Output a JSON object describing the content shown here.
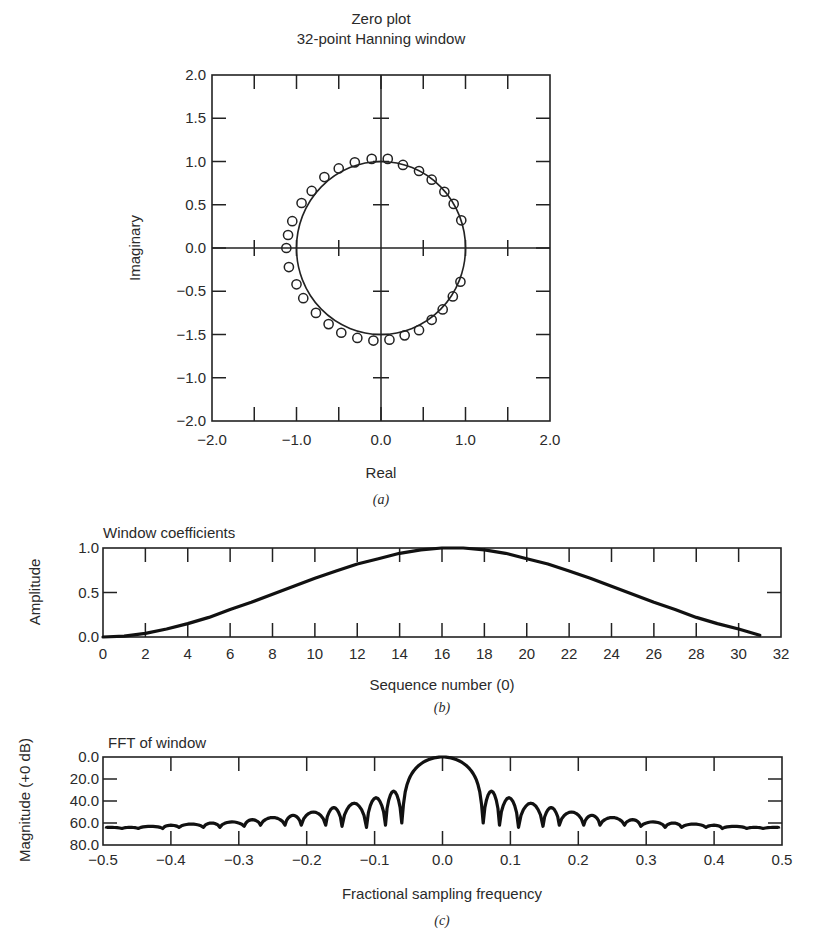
{
  "chart_data": [
    {
      "id": "a",
      "type": "scatter",
      "title": [
        "Zero plot",
        "32-point Hanning window"
      ],
      "xlabel": "Real",
      "ylabel": "Imaginary",
      "caption": "(a)",
      "xlim": [
        -2.0,
        2.0
      ],
      "ylim": [
        -2.0,
        2.0
      ],
      "xticks": [
        -2.0,
        -1.5,
        -1.0,
        -0.5,
        0.0,
        0.5,
        1.0,
        1.5,
        2.0
      ],
      "xtick_labels": [
        {
          "v": -2.0,
          "t": "−2.0"
        },
        {
          "v": -1.0,
          "t": "−1.0"
        },
        {
          "v": 0.0,
          "t": "0.0"
        },
        {
          "v": 1.0,
          "t": "1.0"
        },
        {
          "v": 2.0,
          "t": "2.0"
        }
      ],
      "yticks": [
        2.0,
        1.5,
        1.0,
        0.5,
        0.0,
        -0.5,
        -1.0,
        -1.5,
        -2.0
      ],
      "ytick_labels": [
        {
          "v": 2.0,
          "t": "2.0"
        },
        {
          "v": 1.5,
          "t": "1.5"
        },
        {
          "v": 1.0,
          "t": "1.0"
        },
        {
          "v": 0.5,
          "t": "0.5"
        },
        {
          "v": 0.0,
          "t": "0.0"
        },
        {
          "v": -0.5,
          "t": "−0.5"
        },
        {
          "v": -1.0,
          "t": "−1.5"
        },
        {
          "v": -1.5,
          "t": "−1.0"
        },
        {
          "v": -2.0,
          "t": "−2.0"
        }
      ],
      "unit_circle": true,
      "marker": "open-circle",
      "zeros": [
        [
          -1.12,
          0.0
        ],
        [
          -1.1,
          0.15
        ],
        [
          -1.05,
          0.31
        ],
        [
          -0.94,
          0.52
        ],
        [
          -0.82,
          0.66
        ],
        [
          -0.67,
          0.82
        ],
        [
          -0.5,
          0.92
        ],
        [
          -0.31,
          0.99
        ],
        [
          -0.11,
          1.03
        ],
        [
          0.08,
          1.03
        ],
        [
          0.26,
          0.96
        ],
        [
          0.45,
          0.89
        ],
        [
          0.6,
          0.79
        ],
        [
          0.75,
          0.65
        ],
        [
          0.86,
          0.51
        ],
        [
          0.95,
          0.32
        ],
        [
          -1.09,
          -0.22
        ],
        [
          -1.0,
          -0.42
        ],
        [
          -0.92,
          -0.58
        ],
        [
          -0.77,
          -0.75
        ],
        [
          -0.62,
          -0.88
        ],
        [
          -0.47,
          -0.98
        ],
        [
          -0.28,
          -1.04
        ],
        [
          -0.09,
          -1.07
        ],
        [
          0.1,
          -1.06
        ],
        [
          0.28,
          -1.01
        ],
        [
          0.45,
          -0.95
        ],
        [
          0.6,
          -0.83
        ],
        [
          0.73,
          -0.71
        ],
        [
          0.85,
          -0.56
        ],
        [
          0.94,
          -0.39
        ]
      ]
    },
    {
      "id": "b",
      "type": "line",
      "title": "Window coefficients",
      "xlabel": "Sequence number (0)",
      "ylabel": "Amplitude",
      "caption": "(b)",
      "xlim": [
        0,
        32
      ],
      "ylim": [
        0.0,
        1.0
      ],
      "xticks": [
        0,
        2,
        4,
        6,
        8,
        10,
        12,
        14,
        16,
        18,
        20,
        22,
        24,
        26,
        28,
        30,
        32
      ],
      "yticks": [
        0.0,
        0.5,
        1.0
      ],
      "ytick_labels": [
        "0.0",
        "0.5",
        "1.0"
      ],
      "x": [
        0,
        1,
        2,
        3,
        4,
        5,
        6,
        7,
        8,
        9,
        10,
        11,
        12,
        13,
        14,
        15,
        16,
        17,
        18,
        19,
        20,
        21,
        22,
        23,
        24,
        25,
        26,
        27,
        28,
        29,
        30,
        31
      ],
      "values": [
        0.0,
        0.01,
        0.04,
        0.09,
        0.15,
        0.22,
        0.31,
        0.39,
        0.48,
        0.57,
        0.66,
        0.74,
        0.82,
        0.88,
        0.94,
        0.98,
        1.0,
        1.0,
        0.98,
        0.94,
        0.88,
        0.82,
        0.74,
        0.66,
        0.57,
        0.48,
        0.39,
        0.31,
        0.22,
        0.15,
        0.09,
        0.02
      ]
    },
    {
      "id": "c",
      "type": "line",
      "title": "FFT of window",
      "xlabel": "Fractional sampling frequency",
      "ylabel": "Magnitude (+0 dB)",
      "caption": "(c)",
      "xlim": [
        -0.5,
        0.5
      ],
      "ylim": [
        0.0,
        80.0
      ],
      "y_inverted": true,
      "xticks": [
        -0.5,
        -0.4,
        -0.3,
        -0.2,
        -0.1,
        0.0,
        0.1,
        0.2,
        0.3,
        0.4,
        0.5
      ],
      "xtick_labels": [
        "−0.5",
        "−0.4",
        "−0.3",
        "−0.2",
        "−0.1",
        "0.0",
        "0.1",
        "0.2",
        "0.3",
        "0.4",
        "0.5"
      ],
      "yticks": [
        0.0,
        20.0,
        40.0,
        60.0,
        80.0
      ],
      "ytick_labels": [
        "0.0",
        "20.0",
        "40.0",
        "60.0",
        "80.0"
      ],
      "mainlobe_null": 0.06,
      "sidelobes": [
        {
          "f": 0.072,
          "peak_db": 31,
          "null_db": 62
        },
        {
          "f": 0.098,
          "peak_db": 37,
          "null_db": 64
        },
        {
          "f": 0.13,
          "peak_db": 42,
          "null_db": 63
        },
        {
          "f": 0.16,
          "peak_db": 46,
          "null_db": 62
        },
        {
          "f": 0.19,
          "peak_db": 50,
          "null_db": 62
        },
        {
          "f": 0.22,
          "peak_db": 53,
          "null_db": 62
        },
        {
          "f": 0.25,
          "peak_db": 55,
          "null_db": 62
        },
        {
          "f": 0.28,
          "peak_db": 57,
          "null_db": 63
        },
        {
          "f": 0.31,
          "peak_db": 59,
          "null_db": 64
        },
        {
          "f": 0.34,
          "peak_db": 60,
          "null_db": 64
        },
        {
          "f": 0.37,
          "peak_db": 61,
          "null_db": 64
        },
        {
          "f": 0.4,
          "peak_db": 62,
          "null_db": 65
        },
        {
          "f": 0.43,
          "peak_db": 63,
          "null_db": 65
        },
        {
          "f": 0.46,
          "peak_db": 64,
          "null_db": 65
        },
        {
          "f": 0.49,
          "peak_db": 64,
          "null_db": 65
        }
      ]
    }
  ]
}
